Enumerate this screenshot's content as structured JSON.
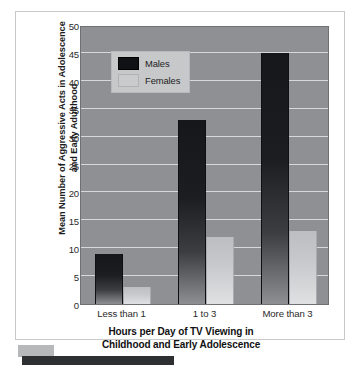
{
  "figure": {
    "y_axis_title": "Mean Number of Aggressive Acts in Adolescence and Early Adulthood",
    "x_axis_title_line1": "Hours per Day of TV Viewing in",
    "x_axis_title_line2": "Childhood and Early Adolescence",
    "plot_background_color": "#8e9094",
    "gridline_color": "#d6d8da"
  },
  "legend": {
    "position": "top-left-inside-plot",
    "entries": [
      {
        "label": "Males",
        "color": "#101114",
        "swatch_name": "legend-swatch-males"
      },
      {
        "label": "Females",
        "color": "#c9cbcd",
        "swatch_name": "legend-swatch-females"
      }
    ]
  },
  "chart_data": {
    "type": "bar",
    "title": "",
    "subtitle": "",
    "xlabel": "Hours per Day of TV Viewing in Childhood and Early Adolescence",
    "ylabel": "Mean Number of Aggressive Acts in Adolescence and Early Adulthood",
    "categories": [
      "Less than 1",
      "1 to 3",
      "More than 3"
    ],
    "series": [
      {
        "name": "Males",
        "color": "#101114",
        "values": [
          9,
          33,
          45
        ]
      },
      {
        "name": "Females",
        "color": "#c9cbcd",
        "values": [
          3,
          12,
          13
        ]
      }
    ],
    "ylim": [
      0,
      50
    ],
    "ytick_step": 5,
    "ytick_labels": [
      "0",
      "5",
      "10",
      "15",
      "20",
      "25",
      "30",
      "35",
      "40",
      "45",
      "50"
    ],
    "xtick_labels": [
      "Less than 1",
      "1 to 3",
      "More than 3"
    ],
    "grid": true,
    "grid_axis": "y",
    "legend_position": "upper left"
  }
}
